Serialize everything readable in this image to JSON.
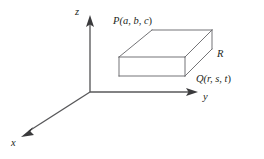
{
  "figure": {
    "name": "rectangular-box-in-3d-coordinate-system",
    "background_color": "#ffffff",
    "axis_color": "#58585a",
    "edge_color": "#6d6d70",
    "hidden_edge_color": "#9b9b9e",
    "text_color": "#231f20"
  },
  "axes": {
    "origin": {
      "x": 90,
      "y": 92
    },
    "z": {
      "label": "z",
      "tip": {
        "x": 90,
        "y": 17
      },
      "label_pos": {
        "x": 75,
        "y": 7
      }
    },
    "y": {
      "label": "y",
      "tip": {
        "x": 197,
        "y": 92
      },
      "label_pos": {
        "x": 203,
        "y": 92
      }
    },
    "x": {
      "label": "x",
      "tip": {
        "x": 22,
        "y": 137
      },
      "label_pos": {
        "x": 11,
        "y": 138
      }
    }
  },
  "box": {
    "front_face": {
      "top_left": {
        "x": 119,
        "y": 57
      },
      "top_right": {
        "x": 185,
        "y": 57
      },
      "bottom_right": {
        "x": 185,
        "y": 76
      },
      "bottom_left": {
        "x": 119,
        "y": 76
      }
    },
    "back_face": {
      "top_left": {
        "x": 152,
        "y": 30
      },
      "top_right": {
        "x": 212,
        "y": 30
      },
      "bottom_right": {
        "x": 212,
        "y": 49
      },
      "bottom_left": {
        "x": 152,
        "y": 49
      }
    },
    "depth_offset": {
      "dx": 33,
      "dy": -27
    },
    "hidden_edges": [
      "back-bottom-left-vertical",
      "back-bottom-horizontal-left",
      "back-bottom-diagonal-left"
    ]
  },
  "labels": {
    "vertex_P": {
      "text": "P(a, b, c)",
      "prefix": "P(",
      "vars": "a, b, c",
      "suffix": ")",
      "anchor": {
        "x": 152,
        "y": 30
      }
    },
    "vertex_Q": {
      "text": "Q(r, s, t)",
      "prefix": "Q(",
      "vars": "r, s, t",
      "suffix": ")",
      "anchor": {
        "x": 185,
        "y": 76
      }
    },
    "region_R": {
      "text": "R",
      "anchor": {
        "x": 212,
        "y": 49
      }
    }
  }
}
